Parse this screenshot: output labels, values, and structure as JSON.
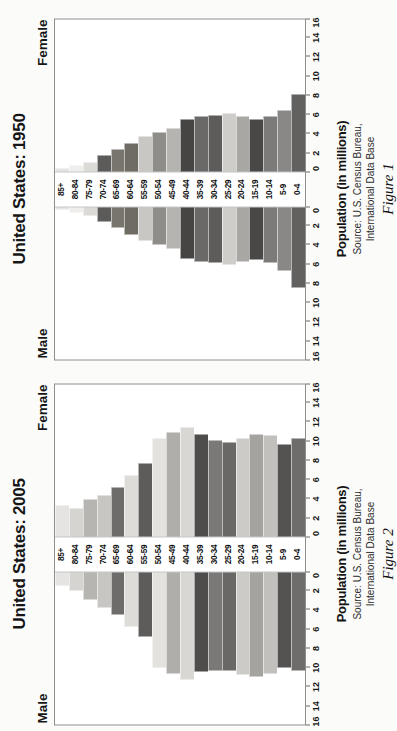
{
  "document": {
    "type": "scanned-page",
    "orientation": "rotated-90-ccw",
    "page_number": "24"
  },
  "figures": [
    {
      "id": "figure-2",
      "title": "United States: 2005",
      "left_label": "Male",
      "right_label": "Female",
      "axis_title": "Population (in millions)",
      "source_line1": "Source: U.S. Census Bureau,",
      "source_line2": "International Data Base",
      "caption": "Figure 2"
    },
    {
      "id": "figure-1",
      "title": "United States: 1950",
      "left_label": "Male",
      "right_label": "Female",
      "axis_title": "Population (in millions)",
      "source_line1": "Source: U.S. Census Bureau,",
      "source_line2": "International Data Base",
      "caption": "Figure 1"
    }
  ],
  "chart_data": [
    {
      "type": "bar",
      "subtype": "population-pyramid",
      "title": "United States: 2005",
      "xlabel": "Population (in millions)",
      "ylabel": "",
      "categories": [
        "85+",
        "80-84",
        "75-79",
        "70-74",
        "65-69",
        "60-64",
        "55-59",
        "50-54",
        "45-49",
        "40-44",
        "35-39",
        "30-34",
        "25-29",
        "20-24",
        "15-19",
        "10-14",
        "5-9",
        "0-4"
      ],
      "xlim": [
        0,
        16
      ],
      "xticks": [
        0,
        2,
        4,
        6,
        8,
        10,
        12,
        14,
        16
      ],
      "grid": false,
      "legend": [
        "Male",
        "Female"
      ],
      "legend_position": "top-outside",
      "series": [
        {
          "name": "Male",
          "side": "left",
          "values": [
            1.4,
            1.9,
            2.8,
            3.6,
            4.4,
            5.6,
            6.7,
            9.9,
            10.5,
            11.1,
            10.3,
            10.2,
            10.2,
            10.6,
            10.8,
            10.5,
            9.9,
            10.2
          ]
        },
        {
          "name": "Female",
          "side": "right",
          "values": [
            3.2,
            2.9,
            3.9,
            4.3,
            5.1,
            6.3,
            7.6,
            10.2,
            10.8,
            11.3,
            10.6,
            10.0,
            9.8,
            10.2,
            10.6,
            10.5,
            9.6,
            10.2
          ]
        }
      ],
      "bar_shades": [
        "#e6e4e2",
        "#d6d4d1",
        "#b7b5b2",
        "#c8c6c3",
        "#6e6c6b",
        "#dedcd9",
        "#5e5c5b",
        "#e4e2df",
        "#b0aeab",
        "#d9d7d4",
        "#4f4d4c",
        "#7b7978",
        "#6a6867",
        "#cdcbc8",
        "#a5a3a0",
        "#c2c0bd",
        "#555352",
        "#6f6d6c"
      ]
    },
    {
      "type": "bar",
      "subtype": "population-pyramid",
      "title": "United States: 1950",
      "xlabel": "Population (in millions)",
      "ylabel": "",
      "categories": [
        "85+",
        "80-84",
        "75-79",
        "70-74",
        "65-69",
        "60-64",
        "55-59",
        "50-54",
        "45-49",
        "40-44",
        "35-39",
        "30-34",
        "25-29",
        "20-24",
        "15-19",
        "10-14",
        "5-9",
        "0-4"
      ],
      "xlim": [
        0,
        16
      ],
      "xticks": [
        0,
        2,
        4,
        6,
        8,
        10,
        12,
        14,
        16
      ],
      "grid": false,
      "legend": [
        "Male",
        "Female"
      ],
      "legend_position": "top-outside",
      "series": [
        {
          "name": "Male",
          "side": "left",
          "values": [
            0.2,
            0.5,
            0.8,
            1.5,
            2.1,
            2.8,
            3.4,
            3.9,
            4.3,
            5.3,
            5.6,
            5.7,
            5.9,
            5.6,
            5.4,
            5.7,
            6.6,
            8.3
          ]
        },
        {
          "name": "Female",
          "side": "right",
          "values": [
            0.3,
            0.6,
            0.9,
            1.7,
            2.3,
            2.9,
            3.6,
            4.1,
            4.5,
            5.4,
            5.7,
            5.8,
            6.0,
            5.7,
            5.4,
            5.7,
            6.4,
            8.0
          ]
        }
      ],
      "bar_shades": [
        "#e6e4e2",
        "#efeeec",
        "#dcdad7",
        "#5d5b5a",
        "#77756d",
        "#6e6c63",
        "#c9c7c4",
        "#8f8d8a",
        "#b6b4b1",
        "#474544",
        "#6b6968",
        "#5e5c5b",
        "#cfcdca",
        "#a9a7a4",
        "#4a4847",
        "#7d7b7a",
        "#8a8887",
        "#63615f"
      ]
    }
  ]
}
